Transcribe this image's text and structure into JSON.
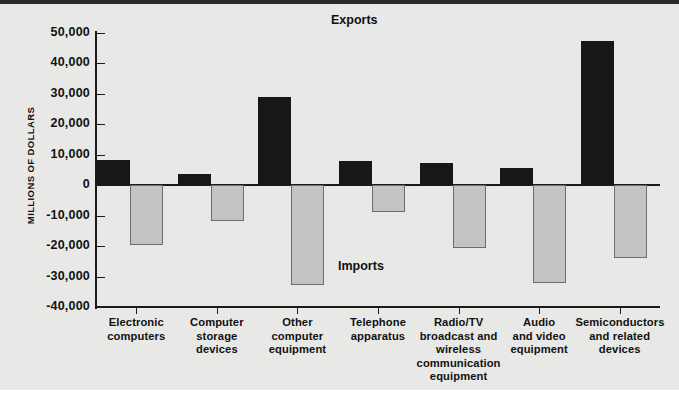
{
  "chart_data": {
    "type": "bar",
    "title": "",
    "xlabel": "",
    "ylabel": "MILLIONS OF DOLLARS",
    "ylim": [
      -40000,
      50000
    ],
    "ytick_step": 10000,
    "grid": false,
    "orientation": "vertical",
    "legend_position": "inline-annotation",
    "categories": [
      "Electronic computers",
      "Computer storage devices",
      "Other computer equipment",
      "Telephone apparatus",
      "Radio/TV broadcast and wireless communication equipment",
      "Audio and video equipment",
      "Semiconductors and related devices"
    ],
    "category_lines": [
      [
        "Electronic",
        "computers"
      ],
      [
        "Computer",
        "storage",
        "devices"
      ],
      [
        "Other",
        "computer",
        "equipment"
      ],
      [
        "Telephone",
        "apparatus"
      ],
      [
        "Radio/TV",
        "broadcast and",
        "wireless",
        "communication",
        "equipment"
      ],
      [
        "Audio",
        "and video",
        "equipment"
      ],
      [
        "Semiconductors",
        "and related",
        "devices"
      ]
    ],
    "series": [
      {
        "name": "Exports",
        "color": "#17171a",
        "values": [
          8200,
          3700,
          29000,
          7900,
          7200,
          5800,
          47500
        ]
      },
      {
        "name": "Imports",
        "color": "#c3c3c1",
        "values": [
          -19700,
          -11600,
          -32900,
          -8900,
          -20700,
          -32000,
          -24000
        ]
      }
    ],
    "ytick_labels": [
      "50,000",
      "40,000",
      "30,000",
      "20,000",
      "10,000",
      "0",
      "-10,000",
      "-20,000",
      "-30,000",
      "-40,000"
    ],
    "ytick_values": [
      50000,
      40000,
      30000,
      20000,
      10000,
      0,
      -10000,
      -20000,
      -30000,
      -40000
    ],
    "annotations": [
      {
        "text": "Exports",
        "series": "Exports"
      },
      {
        "text": "Imports",
        "series": "Imports"
      }
    ]
  }
}
